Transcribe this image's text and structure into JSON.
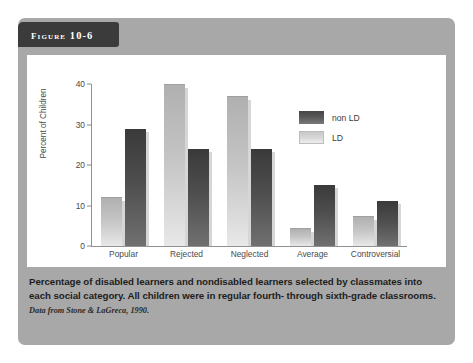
{
  "figure": {
    "tab_label": "Figure 10-6",
    "caption": "Percentage of disabled learners and nondisabled learners selected by classmates into each social category. All children were in regular fourth- through sixth-grade classrooms.",
    "source": "Data from Stone & LaGreca, 1990."
  },
  "legend": {
    "entries": [
      {
        "label": "non LD",
        "swatch": "dark-gray",
        "color": "#4e4e4e"
      },
      {
        "label": "LD",
        "swatch": "light-gray",
        "color": "#d6d6d6"
      }
    ]
  },
  "chart_data": {
    "type": "bar",
    "title": "",
    "xlabel": "",
    "ylabel": "Percent of Children",
    "ylim": [
      0,
      40
    ],
    "yticks": [
      0,
      10,
      20,
      30,
      40
    ],
    "grid": false,
    "legend_position": "upper-right",
    "categories": [
      "Popular",
      "Rejected",
      "Neglected",
      "Average",
      "Controversial"
    ],
    "series": [
      {
        "name": "LD",
        "color": "#d6d6d6",
        "values": [
          12,
          40,
          37,
          4.5,
          7.5
        ]
      },
      {
        "name": "non LD",
        "color": "#4e4e4e",
        "values": [
          29,
          24,
          24,
          15,
          11
        ]
      }
    ]
  }
}
